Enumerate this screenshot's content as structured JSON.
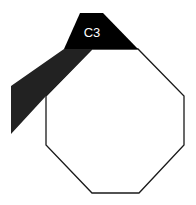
{
  "diagram": {
    "label": "C3",
    "colors": {
      "background": "#ffffff",
      "octagon_fill": "#ffffff",
      "octagon_stroke": "#1a1a1a",
      "band_top": "#000000",
      "band_lower": "#222222",
      "label": "#ffffff"
    },
    "octagon_points": "92,49 138,49 184,96 184,145 139,193 92,193 46,145 46,96",
    "band_top_points": "80,13 103,13 138,49 64,49",
    "band_lower_points": "64,49 92,49 46,96 11,134 11,86"
  }
}
